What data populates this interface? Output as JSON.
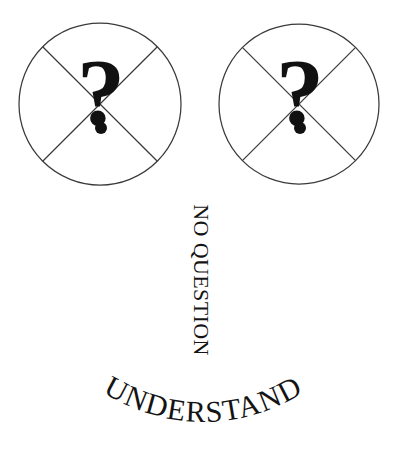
{
  "canvas": {
    "width": 403,
    "height": 452,
    "background_color": "#ffffff",
    "ink_color": "#141414",
    "stroke_color": "#3a3a3a"
  },
  "symbols": {
    "circle_left": {
      "name": "crossed-circle-left",
      "glyph": "?",
      "center_x": 100,
      "center_y": 104,
      "radius": 81,
      "has_cross": true,
      "has_detached_dot": true
    },
    "circle_right": {
      "name": "crossed-circle-right",
      "glyph": "?",
      "center_x": 299,
      "center_y": 104,
      "radius": 80,
      "has_cross": true,
      "has_detached_dot": true
    }
  },
  "texts": {
    "vertical_label": "NO QUESTION",
    "vertical_rotation_degrees": 90,
    "arc_label": "UNDERSTAND",
    "arc_curve": "downward"
  }
}
